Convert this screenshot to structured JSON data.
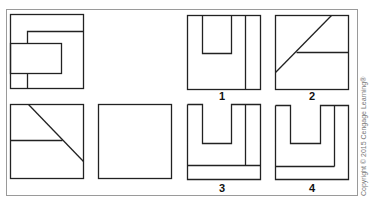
{
  "diagram": {
    "type": "orthographic-projection-exercise",
    "given_views": [
      {
        "id": "top-left",
        "description": "square with offset rectangle and stepped inner lines"
      },
      {
        "id": "bottom-left",
        "description": "square with diagonal and horizontal line"
      },
      {
        "id": "bottom-middle",
        "description": "empty square (view to complete)"
      }
    ],
    "options": [
      {
        "label": "1"
      },
      {
        "label": "2"
      },
      {
        "label": "3"
      },
      {
        "label": "4"
      }
    ],
    "copyright": "Copyright © 2015 Cengage Learning®",
    "colors": {
      "line": "#222222",
      "frame": "#9a9a9a",
      "background": "#ffffff"
    }
  }
}
